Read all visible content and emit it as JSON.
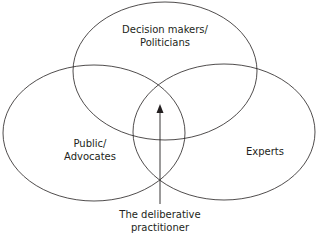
{
  "diagram": {
    "type": "venn",
    "circles": [
      {
        "id": "top",
        "label_lines": [
          "Decision makers/",
          "Politicians"
        ]
      },
      {
        "id": "left",
        "label_lines": [
          "Public/",
          "Advocates"
        ]
      },
      {
        "id": "right",
        "label_lines": [
          "Experts"
        ]
      }
    ],
    "pointer": {
      "label_lines": [
        "The deliberative",
        "practitioner"
      ]
    },
    "colors": {
      "stroke": "#231f20",
      "background": "#ffffff"
    }
  }
}
